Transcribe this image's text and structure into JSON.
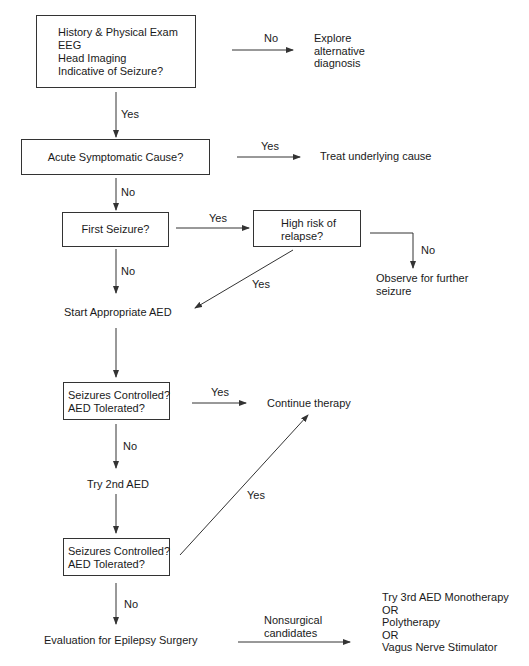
{
  "diagram": {
    "type": "flowchart",
    "nodes": {
      "history": {
        "lines": "History & Physical Exam\nEEG\nHead Imaging\nIndicative of Seizure?"
      },
      "explore": {
        "lines": "Explore\nalternative\ndiagnosis"
      },
      "acute": {
        "label": "Acute Symptomatic Cause?"
      },
      "treat": {
        "label": "Treat underlying cause"
      },
      "first": {
        "label": "First Seizure?"
      },
      "highrisk": {
        "lines": "High risk of\nrelapse?"
      },
      "observe": {
        "lines": "Observe for further\nseizure"
      },
      "start_aed": {
        "label": "Start Appropriate AED"
      },
      "controlled1": {
        "lines": "Seizures Controlled?\nAED Tolerated?"
      },
      "continue": {
        "label": "Continue therapy"
      },
      "try2nd": {
        "label": "Try 2nd AED"
      },
      "controlled2": {
        "lines": "Seizures Controlled?\nAED Tolerated?"
      },
      "surgery": {
        "label": "Evaluation for Epilepsy Surgery"
      },
      "options": {
        "lines": "Try 3rd AED Monotherapy\nOR\nPolytherapy\nOR\nVagus Nerve Stimulator"
      }
    },
    "edges": {
      "history_explore": "No",
      "history_acute": "Yes",
      "acute_treat": "Yes",
      "acute_first": "No",
      "first_highrisk": "Yes",
      "first_start": "No",
      "highrisk_observe": "No",
      "highrisk_start": "Yes",
      "controlled1_continue": "Yes",
      "controlled1_try2nd": "No",
      "controlled2_continue": "Yes",
      "controlled2_surgery": "No",
      "surgery_options": "Nonsurgical\ncandidates"
    },
    "colors": {
      "line": "#333333",
      "text": "#1a1a1a",
      "background": "#ffffff"
    }
  }
}
